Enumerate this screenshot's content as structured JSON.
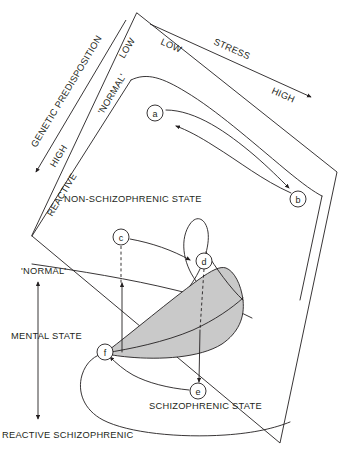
{
  "figure": {
    "type": "diagram",
    "background_color": "#ffffff",
    "line_color": "#231f20",
    "shaded_region_color": "#c9c9c9"
  },
  "axes": {
    "stress": {
      "name": "STRESS",
      "low_label": "LOW",
      "high_label": "HIGH",
      "orientation": "top-edge-diagonal-left-to-right",
      "arrow": "to-high"
    },
    "genetic_predisposition": {
      "name": "GENETIC PREDISPOSITION",
      "low_label": "LOW",
      "high_label": "HIGH",
      "orientation": "left-edge-diagonal-down-left",
      "arrow": "to-high"
    },
    "predisposition_inner": {
      "normal_label": "'NORMAL'",
      "reactive_label": "REACTIVE"
    },
    "mental_state": {
      "name": "MENTAL STATE",
      "top_label": "'NORMAL'",
      "bottom_label": "REACTIVE SCHIZOPHRENIC",
      "orientation": "vertical-left",
      "arrow": "double-headed"
    }
  },
  "regions": [
    {
      "id": "non-schizophrenic",
      "label": "NON-SCHIZOPHRENIC STATE"
    },
    {
      "id": "schizophrenic",
      "label": "SCHIZOPHRENIC STATE"
    }
  ],
  "markers": [
    {
      "id": "a",
      "label": "a",
      "cx": 155,
      "cy": 113,
      "r": 8.0
    },
    {
      "id": "b",
      "label": "b",
      "cx": 298,
      "cy": 199,
      "r": 8.0
    },
    {
      "id": "c",
      "label": "c",
      "cx": 121,
      "cy": 237,
      "r": 8.0
    },
    {
      "id": "d",
      "label": "d",
      "cx": 204,
      "cy": 261,
      "r": 8.0
    },
    {
      "id": "e",
      "label": "e",
      "cx": 198,
      "cy": 391,
      "r": 8.0
    },
    {
      "id": "f",
      "label": "f",
      "cx": 105,
      "cy": 352,
      "r": 8.0
    }
  ],
  "trajectories": [
    {
      "id": "a-to-b",
      "from": "a",
      "to": "b",
      "style": "solid",
      "direction": "bidirectional"
    },
    {
      "id": "c-to-d",
      "from": "c",
      "to": "d",
      "style": "solid",
      "direction": "forward"
    },
    {
      "id": "c-drop",
      "from": "c",
      "to": "surface",
      "style": "dashed",
      "direction": "down"
    },
    {
      "id": "d-drop",
      "from": "d",
      "to": "e",
      "style": "dashed-then-solid",
      "direction": "down"
    },
    {
      "id": "e-to-f",
      "from": "e",
      "to": "f",
      "style": "solid",
      "direction": "forward"
    },
    {
      "id": "f-rise",
      "from": "f",
      "to": "normal",
      "style": "solid",
      "direction": "up"
    }
  ]
}
